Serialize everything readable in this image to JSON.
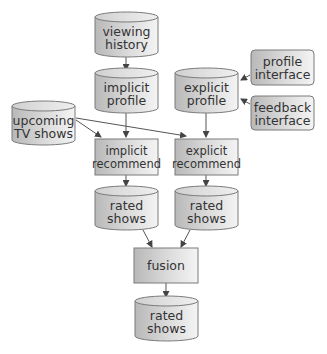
{
  "diagram": {
    "nodes": {
      "viewing_history": {
        "line1": "viewing",
        "line2": "history",
        "shape": "cylinder"
      },
      "implicit_profile": {
        "line1": "implicit",
        "line2": "profile",
        "shape": "cylinder"
      },
      "explicit_profile": {
        "line1": "explicit",
        "line2": "profile",
        "shape": "cylinder"
      },
      "profile_interface": {
        "line1": "profile",
        "line2": "interface",
        "shape": "rounded-rect"
      },
      "feedback_interface": {
        "line1": "feedback",
        "line2": "interface",
        "shape": "rounded-rect"
      },
      "upcoming_tv_shows": {
        "line1": "upcoming",
        "line2": "TV shows",
        "shape": "cylinder"
      },
      "implicit_recommend": {
        "line1": "implicit",
        "line2": "recommend",
        "shape": "rect"
      },
      "explicit_recommend": {
        "line1": "explicit",
        "line2": "recommend",
        "shape": "rect"
      },
      "rated_shows_implicit": {
        "line1": "rated",
        "line2": "shows",
        "shape": "cylinder"
      },
      "rated_shows_explicit": {
        "line1": "rated",
        "line2": "shows",
        "shape": "cylinder"
      },
      "fusion": {
        "line1": "fusion",
        "shape": "rect"
      },
      "rated_shows_final": {
        "line1": "rated",
        "line2": "shows",
        "shape": "cylinder"
      }
    },
    "edges": [
      [
        "viewing_history",
        "implicit_profile"
      ],
      [
        "profile_interface",
        "explicit_profile"
      ],
      [
        "feedback_interface",
        "explicit_profile"
      ],
      [
        "implicit_profile",
        "implicit_recommend"
      ],
      [
        "explicit_profile",
        "explicit_recommend"
      ],
      [
        "upcoming_tv_shows",
        "implicit_recommend"
      ],
      [
        "upcoming_tv_shows",
        "explicit_recommend"
      ],
      [
        "implicit_recommend",
        "rated_shows_implicit"
      ],
      [
        "explicit_recommend",
        "rated_shows_explicit"
      ],
      [
        "rated_shows_implicit",
        "fusion"
      ],
      [
        "rated_shows_explicit",
        "fusion"
      ],
      [
        "fusion",
        "rated_shows_final"
      ]
    ],
    "colors": {
      "fill_dark": "#bdbdbd",
      "fill_light": "#f2f2f2",
      "stroke": "#777777",
      "text": "#333333",
      "arrow": "#444444"
    }
  }
}
